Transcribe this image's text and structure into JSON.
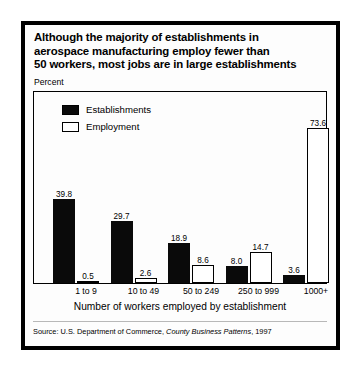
{
  "title": {
    "line1": "Although the majority of establishments in",
    "line2": "aerospace manufacturing employ fewer than",
    "line3": "50 workers, most jobs are in large establishments"
  },
  "axis": {
    "y_unit_label": "Percent",
    "x_title": "Number of workers employed by establishment"
  },
  "legend": {
    "items": [
      {
        "label": "Establishments",
        "color": "#0a0a0a",
        "style": "filled"
      },
      {
        "label": "Employment",
        "color": "#ffffff",
        "style": "hollow"
      }
    ]
  },
  "source": {
    "prefix": "Source: U.S. Department of Commerce, ",
    "publication": "County Business Patterns",
    "suffix": ", 1997"
  },
  "chart_data": {
    "type": "bar",
    "title": "Although the majority of establishments in aerospace manufacturing employ fewer than 50 workers, most jobs are in large establishments",
    "xlabel": "Number of workers employed by establishment",
    "ylabel": "Percent",
    "ylim": [
      0,
      80
    ],
    "grid": false,
    "legend_position": "top-left",
    "categories": [
      "1 to 9",
      "10 to 49",
      "50 to 249",
      "250 to 999",
      "1000+"
    ],
    "series": [
      {
        "name": "Establishments",
        "color": "#0a0a0a",
        "values": [
          39.8,
          29.7,
          18.9,
          8.0,
          3.6
        ],
        "labels": [
          "39.8",
          "29.7",
          "18.9",
          "8.0",
          "3.6"
        ]
      },
      {
        "name": "Employment",
        "color": "#ffffff",
        "values": [
          0.5,
          2.6,
          8.6,
          14.7,
          73.6
        ],
        "labels": [
          "0.5",
          "2.6",
          "8.6",
          "14.7",
          "73.6"
        ]
      }
    ],
    "source": "Source: U.S. Department of Commerce, County Business Patterns, 1997"
  }
}
